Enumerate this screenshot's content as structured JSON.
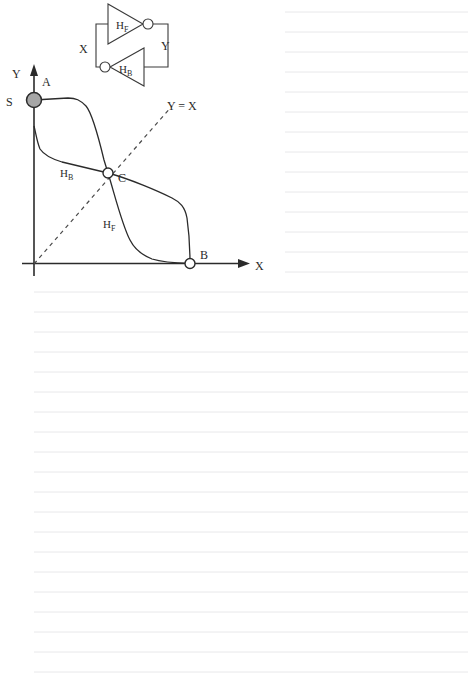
{
  "page": {
    "background_color": "#ffffff",
    "paper_type": "ruled-notebook-page",
    "rule_color": "#e8e8ea",
    "rule_spacing_px": 20,
    "rule_count_top_right": 14,
    "rule_count_bottom_full": 20
  },
  "figure": {
    "name": "cross-coupled-inverter-transfer-characteristics",
    "ink_color": "#2b2b2b",
    "fill_color_node_A": "#a6a6a6",
    "circuit": {
      "caption_free": true,
      "input_label": "X",
      "output_label": "Y",
      "forward_inverter_label": "H",
      "forward_inverter_subscript": "F",
      "backward_inverter_label": "H",
      "backward_inverter_subscript": "B"
    },
    "axes": {
      "x_label": "X",
      "y_label": "Y",
      "origin_label": "S"
    },
    "diagonal": {
      "label": "Y = X",
      "style": "dashed"
    },
    "curves": [
      {
        "name": "forward-transfer-curve",
        "label": "H",
        "subscript": "F",
        "from": "A",
        "to": "B"
      },
      {
        "name": "backward-transfer-curve",
        "label": "H",
        "subscript": "B",
        "from": "S",
        "to": "B"
      }
    ],
    "points": [
      {
        "id": "A",
        "label": "A",
        "style": "filled",
        "x": 34,
        "y": 100
      },
      {
        "id": "C",
        "label": "C",
        "style": "open",
        "x": 108,
        "y": 173
      },
      {
        "id": "B",
        "label": "B",
        "style": "open",
        "x": 190,
        "y": 263
      }
    ]
  },
  "chart_data": {
    "type": "line",
    "title": "",
    "xlabel": "X",
    "ylabel": "Y",
    "xlim": [
      0,
      1
    ],
    "ylim": [
      0,
      1
    ],
    "grid": false,
    "legend": "inline-annotations",
    "annotations": [
      {
        "text": "Y = X",
        "kind": "diagonal-reference-line"
      },
      {
        "text": "S",
        "kind": "origin-axis-marker"
      },
      {
        "text": "A",
        "kind": "stable-point-high"
      },
      {
        "text": "C",
        "kind": "metastable-point"
      },
      {
        "text": "B",
        "kind": "stable-point-low"
      },
      {
        "text": "HF",
        "kind": "curve-label"
      },
      {
        "text": "HB",
        "kind": "curve-label"
      }
    ],
    "series": [
      {
        "name": "HF",
        "description": "forward inverter transfer curve, falls from A (0, high) through C to B (high, 0)",
        "x": [
          0.0,
          0.17,
          0.25,
          0.31,
          0.35,
          0.42,
          0.47,
          0.54,
          0.6,
          0.73
        ],
        "y": [
          0.93,
          0.95,
          0.92,
          0.77,
          0.62,
          0.47,
          0.2,
          0.07,
          0.04,
          0.035
        ]
      },
      {
        "name": "HB",
        "description": "backward inverter transfer curve, falls from S through C to B",
        "x": [
          0.0,
          0.02,
          0.09,
          0.25,
          0.35,
          0.47,
          0.63,
          0.7,
          0.72,
          0.73
        ],
        "y": [
          0.82,
          0.78,
          0.7,
          0.6,
          0.55,
          0.47,
          0.4,
          0.37,
          0.18,
          0.035
        ]
      },
      {
        "name": "Y = X",
        "description": "unity-slope dashed reference line",
        "x": [
          0.0,
          0.68
        ],
        "y": [
          0.0,
          0.68
        ]
      }
    ]
  }
}
